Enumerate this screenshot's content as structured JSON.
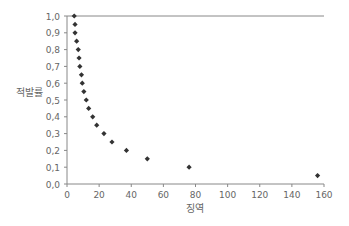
{
  "chart_data": {
    "type": "scatter",
    "title": "",
    "xlabel": "징역",
    "ylabel": "적발률",
    "xlim": [
      0,
      160
    ],
    "ylim": [
      0.0,
      1.0
    ],
    "xticks": [
      0,
      20,
      40,
      60,
      80,
      100,
      120,
      140,
      160
    ],
    "yticks": [
      "0,0",
      "0,1",
      "0,2",
      "0,3",
      "0,4",
      "0,5",
      "0,6",
      "0,7",
      "0,8",
      "0,9",
      "1,0"
    ],
    "grid": false,
    "legend": null,
    "reference_line": {
      "y": 1.0,
      "color": "#888888"
    },
    "marker": "diamond",
    "marker_color": "#333333",
    "points": [
      {
        "x": 4.5,
        "y": 1.0
      },
      {
        "x": 5,
        "y": 0.95
      },
      {
        "x": 5,
        "y": 0.9
      },
      {
        "x": 6,
        "y": 0.85
      },
      {
        "x": 7,
        "y": 0.8
      },
      {
        "x": 7.5,
        "y": 0.75
      },
      {
        "x": 8,
        "y": 0.7
      },
      {
        "x": 9,
        "y": 0.65
      },
      {
        "x": 9.5,
        "y": 0.6
      },
      {
        "x": 10.5,
        "y": 0.55
      },
      {
        "x": 12,
        "y": 0.5
      },
      {
        "x": 13.5,
        "y": 0.45
      },
      {
        "x": 16,
        "y": 0.4
      },
      {
        "x": 18.5,
        "y": 0.35
      },
      {
        "x": 23,
        "y": 0.3
      },
      {
        "x": 28,
        "y": 0.25
      },
      {
        "x": 37,
        "y": 0.2
      },
      {
        "x": 50,
        "y": 0.15
      },
      {
        "x": 76,
        "y": 0.1
      },
      {
        "x": 156,
        "y": 0.05
      }
    ]
  }
}
